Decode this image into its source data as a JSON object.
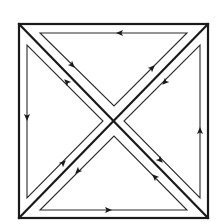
{
  "diagram": {
    "colors": {
      "background": "#ffffff",
      "stroke": "#1a1a1a"
    },
    "outer_square": {
      "x1": 19,
      "y1": 24,
      "x2": 208,
      "y2": 218
    },
    "triangles": [
      {
        "name": "top",
        "loop": [
          [
            40,
            33
          ],
          [
            187,
            33
          ],
          [
            114,
            106
          ]
        ],
        "arrows": [
          {
            "at": [
              120,
              33
            ],
            "dir": "left"
          },
          {
            "at": [
              72,
              65
            ],
            "dir": "down-right"
          },
          {
            "at": [
              152,
              68
            ],
            "dir": "up-right"
          }
        ]
      },
      {
        "name": "left",
        "loop": [
          [
            27,
            45
          ],
          [
            27,
            198
          ],
          [
            103,
            121
          ]
        ],
        "arrows": [
          {
            "at": [
              27,
              117
            ],
            "dir": "down"
          },
          {
            "at": [
              67,
              82
            ],
            "dir": "up-left"
          },
          {
            "at": [
              63,
              163
            ],
            "dir": "up-right"
          }
        ]
      },
      {
        "name": "right",
        "loop": [
          [
            200,
            45
          ],
          [
            200,
            198
          ],
          [
            124,
            121
          ]
        ],
        "arrows": [
          {
            "at": [
              200,
              131
            ],
            "dir": "up"
          },
          {
            "at": [
              165,
              82
            ],
            "dir": "down-left"
          },
          {
            "at": [
              160,
              160
            ],
            "dir": "down-right"
          }
        ]
      },
      {
        "name": "bottom",
        "loop": [
          [
            40,
            210
          ],
          [
            187,
            210
          ],
          [
            114,
            136
          ]
        ],
        "arrows": [
          {
            "at": [
              108,
              210
            ],
            "dir": "right"
          },
          {
            "at": [
              78,
              171
            ],
            "dir": "down-left"
          },
          {
            "at": [
              155,
              177
            ],
            "dir": "up-left"
          }
        ]
      }
    ]
  }
}
